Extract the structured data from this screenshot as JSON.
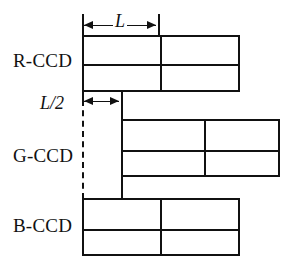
{
  "diagram": {
    "line_color": "#111111",
    "background_color": "#ffffff",
    "rows": [
      {
        "id": "r-ccd",
        "label": "R-CCD",
        "label_x": 13,
        "label_y": 50,
        "box": {
          "x": 82,
          "y": 35,
          "width": 158,
          "height": 57
        },
        "h_divider_y": 27,
        "v_divider_x": 76
      },
      {
        "id": "g-ccd",
        "label": "G-CCD",
        "label_x": 13,
        "label_y": 145,
        "box": {
          "x": 121,
          "y": 119,
          "width": 159,
          "height": 58
        },
        "h_divider_y": 29,
        "v_divider_x": 81
      },
      {
        "id": "b-ccd",
        "label": "B-CCD",
        "label_x": 13,
        "label_y": 215,
        "box": {
          "x": 82,
          "y": 198,
          "width": 158,
          "height": 58
        },
        "h_divider_y": 29,
        "v_divider_x": 76
      }
    ],
    "dimensions": [
      {
        "id": "dim-l",
        "label": "L",
        "label_x": 113,
        "label_y": 11,
        "line_y": 25,
        "x_start": 82,
        "x_end": 158,
        "tick_left": {
          "x": 82,
          "y": 14,
          "height": 22
        },
        "tick_right": {
          "x": 158,
          "y": 14,
          "height": 22
        }
      },
      {
        "id": "dim-l-half",
        "label": "L/2",
        "label_x": 38,
        "label_y": 95,
        "line_y": 101,
        "x_start": 82,
        "x_end": 121,
        "tick_left": {
          "x": 82,
          "y": 92,
          "height": 12
        },
        "tick_right": {
          "x": 121,
          "y": 92,
          "height": 12
        }
      }
    ],
    "connectors": [
      {
        "id": "g-ccd-left-stem",
        "type": "solid",
        "x": 121,
        "y": 92,
        "height": 107
      },
      {
        "id": "alignment-reference",
        "type": "dashed",
        "x": 82,
        "y": 100,
        "height": 99
      }
    ]
  }
}
